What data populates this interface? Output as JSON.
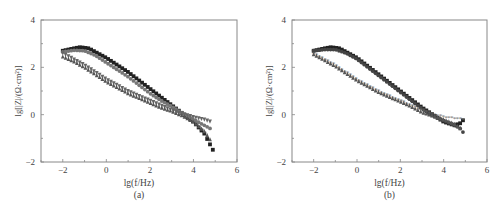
{
  "chart_data": [
    {
      "type": "scatter",
      "panel_label": "(a)",
      "title": "",
      "xlabel": "lg(f/Hz)",
      "ylabel": "lg[|Z|/(Ω·cm²)]",
      "xlim": [
        -3,
        6
      ],
      "ylim": [
        -2,
        4
      ],
      "xticks": [
        "-2",
        "0",
        "2",
        "4",
        "6"
      ],
      "yticks": [
        "-2",
        "0",
        "2",
        "4"
      ],
      "grid": false,
      "legend": null,
      "series": [
        {
          "name": "series-1",
          "marker": "square",
          "color": "#222222",
          "x": [
            -2,
            -1.5,
            -1.2,
            -0.8,
            0,
            0.5,
            1,
            1.5,
            2,
            2.5,
            3,
            3.5,
            4,
            4.5,
            4.9
          ],
          "y": [
            2.7,
            2.8,
            2.85,
            2.8,
            2.4,
            2.1,
            1.8,
            1.45,
            1.1,
            0.75,
            0.4,
            0.05,
            -0.3,
            -0.8,
            -1.5
          ]
        },
        {
          "name": "series-2",
          "marker": "circle",
          "color": "#777777",
          "x": [
            -2,
            -1.5,
            -1,
            -0.5,
            0,
            0.5,
            1,
            1.5,
            2,
            2.5,
            3,
            3.5,
            4,
            4.5,
            4.8
          ],
          "y": [
            2.65,
            2.72,
            2.7,
            2.5,
            2.2,
            1.9,
            1.6,
            1.25,
            0.9,
            0.6,
            0.35,
            0.05,
            -0.2,
            -0.45,
            -0.6
          ]
        },
        {
          "name": "series-3",
          "marker": "triangle-down",
          "color": "#666666",
          "x": [
            -2,
            -1.5,
            -1,
            -0.5,
            0,
            0.5,
            1,
            1.5,
            2,
            2.5,
            3,
            3.5,
            4,
            4.5,
            4.8
          ],
          "y": [
            2.6,
            2.35,
            2.1,
            1.8,
            1.5,
            1.25,
            1.0,
            0.8,
            0.6,
            0.4,
            0.2,
            0.05,
            -0.1,
            -0.2,
            -0.3
          ]
        },
        {
          "name": "series-4",
          "marker": "triangle-up",
          "color": "#555555",
          "x": [
            -2,
            -1.5,
            -1,
            -0.5,
            0,
            0.5,
            1,
            1.5,
            2,
            2.5,
            3,
            3.5,
            4,
            4.5,
            4.8
          ],
          "y": [
            2.45,
            2.25,
            2.0,
            1.7,
            1.4,
            1.15,
            0.9,
            0.7,
            0.5,
            0.3,
            0.15,
            -0.05,
            -0.3,
            -0.7,
            -1.1
          ]
        }
      ]
    },
    {
      "type": "scatter",
      "panel_label": "(b)",
      "title": "",
      "xlabel": "lg(f/Hz)",
      "ylabel": "lg[|Z|/(Ω·cm²)]",
      "xlim": [
        -3,
        6
      ],
      "ylim": [
        -2,
        4
      ],
      "xticks": [
        "-2",
        "0",
        "2",
        "4",
        "6"
      ],
      "yticks": [
        "-2",
        "0",
        "2",
        "4"
      ],
      "grid": false,
      "legend": null,
      "series": [
        {
          "name": "series-1",
          "marker": "square",
          "color": "#222222",
          "x": [
            -2,
            -1.5,
            -1.2,
            -0.8,
            0,
            0.5,
            1,
            1.5,
            2,
            2.5,
            3,
            3.5,
            4,
            4.5,
            4.8,
            5
          ],
          "y": [
            2.7,
            2.8,
            2.85,
            2.8,
            2.4,
            2.05,
            1.7,
            1.35,
            1.0,
            0.65,
            0.3,
            0.0,
            -0.3,
            -0.45,
            -0.35,
            -0.1
          ]
        },
        {
          "name": "series-2",
          "marker": "circle",
          "color": "#444444",
          "x": [
            -2,
            -1.5,
            -1,
            -0.5,
            0,
            0.5,
            1,
            1.5,
            2,
            2.5,
            3,
            3.5,
            4,
            4.5,
            4.8,
            5
          ],
          "y": [
            2.7,
            2.75,
            2.75,
            2.6,
            2.35,
            2.0,
            1.65,
            1.3,
            0.95,
            0.6,
            0.25,
            -0.05,
            -0.25,
            -0.45,
            -0.6,
            -0.9
          ]
        },
        {
          "name": "series-3",
          "marker": "star",
          "color": "#666666",
          "x": [
            -2,
            -1.5,
            -1,
            -0.5,
            0,
            0.5,
            1,
            1.5,
            2,
            2.5,
            3,
            3.5,
            4,
            4.5,
            5
          ],
          "y": [
            2.6,
            2.35,
            2.1,
            1.8,
            1.5,
            1.25,
            1.0,
            0.8,
            0.6,
            0.4,
            0.2,
            0.05,
            -0.1,
            -0.15,
            -0.2
          ]
        },
        {
          "name": "series-4",
          "marker": "triangle-up",
          "color": "#555555",
          "x": [
            -2,
            -1.5,
            -1,
            -0.5,
            0,
            0.5,
            1,
            1.5,
            2,
            2.5,
            3,
            3.5,
            4,
            4.5,
            4.8
          ],
          "y": [
            2.55,
            2.3,
            2.05,
            1.75,
            1.45,
            1.2,
            0.95,
            0.75,
            0.55,
            0.35,
            0.1,
            -0.05,
            -0.2,
            -0.4,
            -0.6
          ]
        }
      ]
    }
  ],
  "panels": [
    {
      "label": "(a)",
      "xlabel": "lg(f/Hz)",
      "ylabel": "lg[|Z|/(Ω·cm²)]"
    },
    {
      "label": "(b)",
      "xlabel": "lg(f/Hz)",
      "ylabel": "lg[|Z|/(Ω·cm²)]"
    }
  ]
}
